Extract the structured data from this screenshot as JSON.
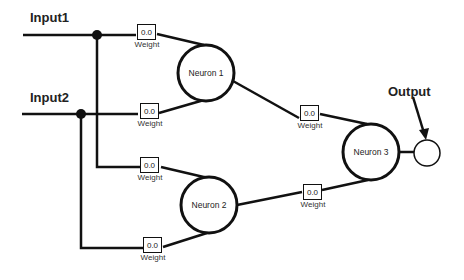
{
  "inputs": [
    {
      "label": "Input1"
    },
    {
      "label": "Input2"
    }
  ],
  "output": {
    "label": "Output"
  },
  "neurons": [
    {
      "label": "Neuron 1"
    },
    {
      "label": "Neuron 2"
    },
    {
      "label": "Neuron 3"
    }
  ],
  "weights": [
    {
      "value": "0.0",
      "label": "Weight"
    },
    {
      "value": "0.0",
      "label": "Weight"
    },
    {
      "value": "0.0",
      "label": "Weight"
    },
    {
      "value": "0.0",
      "label": "Weight"
    },
    {
      "value": "0.0",
      "label": "Weight"
    },
    {
      "value": "0.0",
      "label": "Weight"
    }
  ],
  "colors": {
    "stroke": "#111111",
    "background": "#ffffff"
  }
}
